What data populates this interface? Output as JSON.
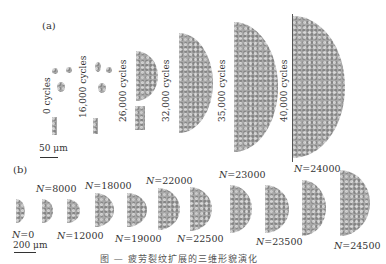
{
  "figure": {
    "panel_a": {
      "label": "(a)",
      "cycle_labels": [
        "0 cycles",
        "16,000 cycles",
        "26,000 cycles",
        "32,000 cycles",
        "35,000 cycles",
        "40,000 cycles"
      ],
      "scale_bar": "50 μm"
    },
    "panel_b": {
      "label": "(b)",
      "n_labels": [
        {
          "var": "N",
          "value": "=0"
        },
        {
          "var": "N",
          "value": "=8000"
        },
        {
          "var": "N",
          "value": "=12000"
        },
        {
          "var": "N",
          "value": "=18000"
        },
        {
          "var": "N",
          "value": "=19000"
        },
        {
          "var": "N",
          "value": "=22000"
        },
        {
          "var": "N",
          "value": "=22500"
        },
        {
          "var": "N",
          "value": "=23000"
        },
        {
          "var": "N",
          "value": "=23500"
        },
        {
          "var": "N",
          "value": "=24000"
        },
        {
          "var": "N",
          "value": "=24500"
        }
      ],
      "scale_bar": "200 μm"
    },
    "caption": "图 — 疲劳裂纹扩展的三维形貌演化"
  }
}
